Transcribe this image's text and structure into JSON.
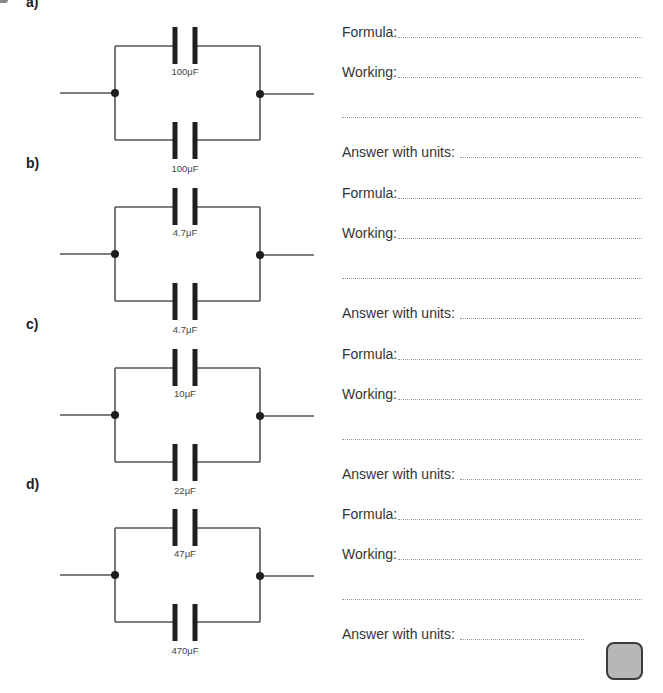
{
  "questions": [
    {
      "part": "a)",
      "capacitors": {
        "top": "100μF",
        "bottom": "100μF"
      },
      "formula_label": "Formula:",
      "working_label": "Working:",
      "answer_label": "Answer with units:",
      "formula_value": "",
      "working_value": "",
      "answer_value": ""
    },
    {
      "part": "b)",
      "capacitors": {
        "top": "4.7μF",
        "bottom": "4.7μF"
      },
      "formula_label": "Formula:",
      "working_label": "Working:",
      "answer_label": "Answer with units:",
      "formula_value": "",
      "working_value": "",
      "answer_value": ""
    },
    {
      "part": "c)",
      "capacitors": {
        "top": "10μF",
        "bottom": "22μF"
      },
      "formula_label": "Formula:",
      "working_label": "Working:",
      "answer_label": "Answer with units:",
      "formula_value": "",
      "working_value": "",
      "answer_value": ""
    },
    {
      "part": "d)",
      "capacitors": {
        "top": "47μF",
        "bottom": "470μF"
      },
      "formula_label": "Formula:",
      "working_label": "Working:",
      "answer_label": "Answer with units:",
      "formula_value": "",
      "working_value": "",
      "answer_value": ""
    }
  ],
  "colors": {
    "wire": "#555555",
    "plate": "#1e1e1e",
    "line": "#9a9a9a",
    "checkbox_fill": "#b7b7b7"
  }
}
